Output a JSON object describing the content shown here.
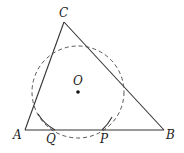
{
  "figure": {
    "type": "geometry",
    "colors": {
      "stroke": "#333333",
      "background": "#ffffff"
    },
    "labels": {
      "A": "A",
      "B": "B",
      "C": "C",
      "O": "O",
      "Q": "Q",
      "P": "P"
    },
    "points": {
      "A": [
        25,
        130
      ],
      "B": [
        164,
        130
      ],
      "C": [
        64,
        22
      ],
      "O": [
        78,
        92
      ],
      "Q": [
        55,
        130
      ],
      "P": [
        102,
        130
      ]
    },
    "circle": {
      "center": "O",
      "radius": 46,
      "style": "dashed"
    }
  }
}
